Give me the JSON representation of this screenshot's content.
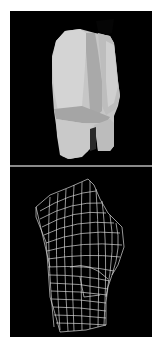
{
  "figure": {
    "panels": [
      {
        "name": "shaded-render",
        "description": "Flat-shaded 3D model of lower torso and upper thighs, rear three-quarter view",
        "background": "#000000",
        "fill": "#c8c8c8"
      },
      {
        "name": "wireframe-render",
        "description": "White wireframe mesh of same lower torso model, side view",
        "background": "#000000",
        "stroke": "#e6e6e6"
      }
    ],
    "divider_color": "#8a8a8a"
  }
}
